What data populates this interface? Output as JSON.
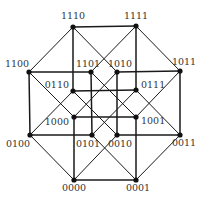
{
  "colors": {
    "edge": "#1a1a1a",
    "node": "#111111",
    "label": "#333333",
    "background": "#ffffff"
  },
  "nodes": [
    {
      "id": "1110",
      "x": 73,
      "y": 27,
      "lx": 73,
      "ly": 19,
      "anchor": "middle"
    },
    {
      "id": "1111",
      "x": 136,
      "y": 26,
      "lx": 136,
      "ly": 19,
      "anchor": "middle"
    },
    {
      "id": "1011",
      "x": 180,
      "y": 71,
      "lx": 184,
      "ly": 65,
      "anchor": "middle"
    },
    {
      "id": "0011",
      "x": 180,
      "y": 135,
      "lx": 184,
      "ly": 146,
      "anchor": "middle"
    },
    {
      "id": "0001",
      "x": 136,
      "y": 180,
      "lx": 138,
      "ly": 191,
      "anchor": "middle"
    },
    {
      "id": "0000",
      "x": 74,
      "y": 180,
      "lx": 74,
      "ly": 191,
      "anchor": "middle"
    },
    {
      "id": "0100",
      "x": 30,
      "y": 135,
      "lx": 18,
      "ly": 147,
      "anchor": "middle"
    },
    {
      "id": "1100",
      "x": 29,
      "y": 72,
      "lx": 17,
      "ly": 67,
      "anchor": "middle"
    },
    {
      "id": "1101",
      "x": 91,
      "y": 72,
      "lx": 88,
      "ly": 67,
      "anchor": "middle"
    },
    {
      "id": "1010",
      "x": 117,
      "y": 72,
      "lx": 120,
      "ly": 67,
      "anchor": "middle"
    },
    {
      "id": "0111",
      "x": 136,
      "y": 90,
      "lx": 141,
      "ly": 88,
      "anchor": "start"
    },
    {
      "id": "1001",
      "x": 136,
      "y": 117,
      "lx": 141,
      "ly": 124,
      "anchor": "start"
    },
    {
      "id": "0010",
      "x": 117,
      "y": 135,
      "lx": 120,
      "ly": 147,
      "anchor": "middle"
    },
    {
      "id": "0101",
      "x": 92,
      "y": 135,
      "lx": 88,
      "ly": 147,
      "anchor": "middle"
    },
    {
      "id": "1000",
      "x": 74,
      "y": 117,
      "lx": 69,
      "ly": 125,
      "anchor": "end"
    },
    {
      "id": "0110",
      "x": 73,
      "y": 91,
      "lx": 69,
      "ly": 88,
      "anchor": "end"
    }
  ]
}
